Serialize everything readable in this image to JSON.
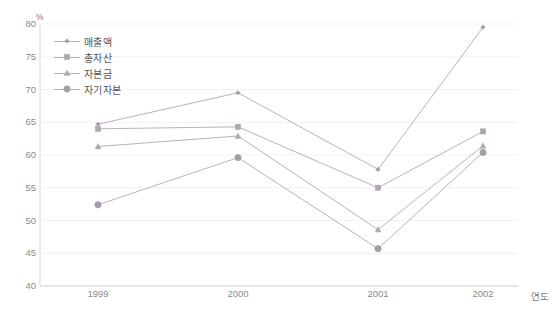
{
  "chart_data": {
    "type": "line",
    "title": "",
    "xlabel": "연도",
    "ylabel": "",
    "unit_label": "%",
    "categories": [
      "1999",
      "2000",
      "2001",
      "2002"
    ],
    "ylim": [
      40,
      80
    ],
    "yticks": [
      40,
      45,
      50,
      55,
      60,
      65,
      70,
      75,
      80
    ],
    "grid": true,
    "legend_position": "upper-left-inside",
    "series": [
      {
        "name": "매출액",
        "marker": "diamond",
        "color": "#a99aa8",
        "values": [
          64.7,
          69.5,
          57.8,
          79.5
        ]
      },
      {
        "name": "총자산",
        "marker": "square",
        "color": "#b0a6b2",
        "values": [
          64.0,
          64.3,
          55.0,
          63.6
        ]
      },
      {
        "name": "자본금",
        "marker": "triangle",
        "color": "#b3a9b4",
        "values": [
          61.3,
          62.9,
          48.6,
          61.4
        ]
      },
      {
        "name": "자기자본",
        "marker": "circle",
        "color": "#a79ca9",
        "values": [
          52.4,
          59.6,
          45.7,
          60.4
        ]
      }
    ]
  },
  "colors": {
    "grid": "#f2f0f3",
    "axis": "#d8d4da",
    "tick_text": "#8a8a8a",
    "legend_text": "#58535a",
    "line": "#b9b2bb",
    "background": "#ffffff"
  },
  "axis": {
    "y_title": "%",
    "x_title": "연도"
  }
}
